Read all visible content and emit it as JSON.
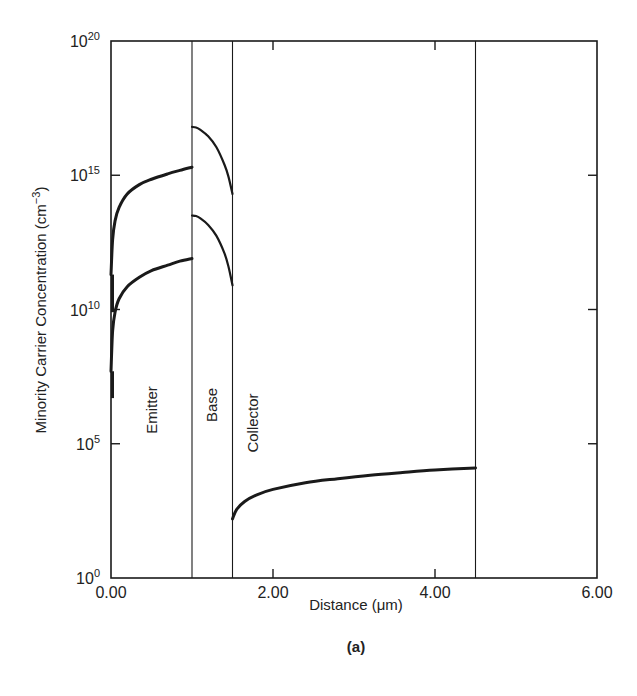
{
  "figure": {
    "caption": "(a)"
  },
  "axes": {
    "xlabel": "Distance (μm)",
    "ylabel": "Minority Carrier Concentration (cm",
    "ylabel_sup": "−3",
    "ylabel_close": ")",
    "x_ticks": [
      {
        "value": 0,
        "label": "0.00"
      },
      {
        "value": 2,
        "label": "2.00"
      },
      {
        "value": 4,
        "label": "4.00"
      },
      {
        "value": 6,
        "label": "6.00"
      }
    ],
    "y_ticks": [
      {
        "exp": 0,
        "base": "10",
        "sup": "0"
      },
      {
        "exp": 5,
        "base": "10",
        "sup": "5"
      },
      {
        "exp": 10,
        "base": "10",
        "sup": "10"
      },
      {
        "exp": 15,
        "base": "10",
        "sup": "15"
      },
      {
        "exp": 20,
        "base": "10",
        "sup": "20"
      }
    ]
  },
  "regions": [
    {
      "name": "Emitter",
      "x_start": 0.0,
      "x_end": 1.0
    },
    {
      "name": "Base",
      "x_start": 1.0,
      "x_end": 1.5
    },
    {
      "name": "Collector",
      "x_start": 1.5,
      "x_end": 4.5
    }
  ],
  "chart_data": {
    "type": "line",
    "title": "",
    "xlabel": "Distance (μm)",
    "ylabel": "Minority Carrier Concentration (cm⁻³)",
    "xlim": [
      0,
      6
    ],
    "ylim": [
      1,
      1e+20
    ],
    "yscale": "log",
    "grid": false,
    "legend": "none",
    "boundaries_x": [
      1.0,
      1.5,
      4.5
    ],
    "series": [
      {
        "name": "Emitter (upper)",
        "region": "Emitter",
        "x": [
          0.0,
          0.02,
          0.05,
          0.1,
          0.2,
          0.35,
          0.5,
          0.7,
          0.85,
          1.0
        ],
        "log10_y": [
          11.3,
          12.6,
          13.3,
          13.8,
          14.3,
          14.65,
          14.85,
          15.05,
          15.18,
          15.3
        ]
      },
      {
        "name": "Emitter (lower)",
        "region": "Emitter",
        "x": [
          0.0,
          0.02,
          0.05,
          0.1,
          0.2,
          0.35,
          0.5,
          0.7,
          0.85,
          1.0
        ],
        "log10_y": [
          7.7,
          9.2,
          9.9,
          10.4,
          10.85,
          11.2,
          11.45,
          11.65,
          11.8,
          11.9
        ]
      },
      {
        "name": "Base (upper)",
        "region": "Base",
        "x": [
          1.0,
          1.05,
          1.1,
          1.2,
          1.3,
          1.4,
          1.45,
          1.5
        ],
        "log10_y": [
          16.8,
          16.78,
          16.7,
          16.45,
          16.05,
          15.4,
          14.95,
          14.3
        ]
      },
      {
        "name": "Base (lower)",
        "region": "Base",
        "x": [
          1.0,
          1.05,
          1.1,
          1.2,
          1.3,
          1.4,
          1.45,
          1.5
        ],
        "log10_y": [
          13.5,
          13.48,
          13.4,
          13.15,
          12.75,
          12.1,
          11.6,
          10.9
        ]
      },
      {
        "name": "Collector",
        "region": "Collector",
        "x": [
          1.5,
          1.55,
          1.65,
          1.8,
          2.0,
          2.4,
          2.8,
          3.2,
          3.6,
          4.0,
          4.5
        ],
        "log10_y": [
          2.2,
          2.55,
          2.85,
          3.1,
          3.3,
          3.55,
          3.7,
          3.83,
          3.93,
          4.02,
          4.1
        ]
      }
    ]
  },
  "colors": {
    "ink": "#1a1a1a",
    "background": "#ffffff"
  }
}
